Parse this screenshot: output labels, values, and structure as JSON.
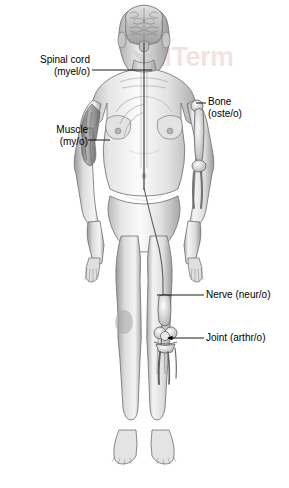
{
  "document": {
    "title": "Anatomy word parts diagram",
    "background_color": "#ffffff",
    "text_color": "#000000"
  },
  "watermark": {
    "text": "alTerm",
    "color": "#b04848",
    "opacity": "0.16"
  },
  "figure": {
    "name": "female-anterior-anatomy-figure",
    "view": "anterior",
    "style": "grayscale pencil shading",
    "skin_light": "#f2f2f2",
    "skin_mid": "#cfcfcf",
    "skin_dark": "#8e8e8e",
    "outline": "#5a5a5a"
  },
  "labels": [
    {
      "id": "spinal-cord",
      "line1": "Spinal cord",
      "line2": "(myel/o)",
      "align": "right",
      "leader": {
        "x1": 92,
        "y1": 70,
        "x2": 152,
        "y2": 70,
        "arrow": false
      }
    },
    {
      "id": "muscle",
      "line1": "Muscle",
      "line2": "(my/o)",
      "align": "right",
      "leader": {
        "x1": 88,
        "y1": 140,
        "x2": 110,
        "y2": 140,
        "arrow": false
      }
    },
    {
      "id": "bone",
      "line1": "Bone",
      "line2": "(oste/o)",
      "align": "left",
      "leader": {
        "x1": 196,
        "y1": 103,
        "x2": 206,
        "y2": 103,
        "arrow": false
      }
    },
    {
      "id": "nerve",
      "line1": "Nerve (neur/o)",
      "line2": "",
      "align": "left",
      "leader": {
        "x1": 157,
        "y1": 295,
        "x2": 204,
        "y2": 295,
        "arrow": false
      }
    },
    {
      "id": "joint",
      "line1": "Joint (arthr/o)",
      "line2": "",
      "align": "left",
      "leader": {
        "x1": 168,
        "y1": 338,
        "x2": 204,
        "y2": 338,
        "arrow": true
      }
    }
  ]
}
